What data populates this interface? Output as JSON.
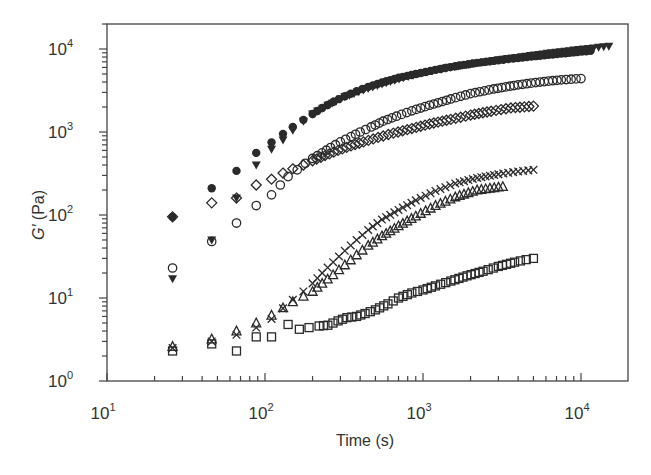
{
  "chart_data": {
    "type": "scatter",
    "title": "",
    "xlabel": "Time (s)",
    "ylabel": "G′ (Pa)",
    "xscale": "log",
    "yscale": "log",
    "xlim": [
      10,
      20000
    ],
    "ylim": [
      1,
      20000
    ],
    "x_ticks": [
      {
        "base": "10",
        "exp": "1",
        "value": 10
      },
      {
        "base": "10",
        "exp": "2",
        "value": 100
      },
      {
        "base": "10",
        "exp": "3",
        "value": 1000
      },
      {
        "base": "10",
        "exp": "4",
        "value": 10000
      }
    ],
    "y_ticks": [
      {
        "base": "10",
        "exp": "0",
        "value": 1
      },
      {
        "base": "10",
        "exp": "1",
        "value": 10
      },
      {
        "base": "10",
        "exp": "2",
        "value": 100
      },
      {
        "base": "10",
        "exp": "3",
        "value": 1000
      },
      {
        "base": "10",
        "exp": "4",
        "value": 10000
      }
    ],
    "grid": false,
    "legend": null,
    "series": [
      {
        "name": "filled-circle",
        "marker": "circle-filled",
        "x": [
          26,
          46,
          66,
          88,
          110,
          130,
          150,
          175,
          200,
          230,
          270,
          320,
          380,
          450,
          550,
          700,
          900,
          1200,
          1600,
          2200,
          3000,
          4000,
          5500,
          7500,
          9500,
          11500
        ],
        "y": [
          95,
          210,
          340,
          560,
          750,
          950,
          1150,
          1400,
          1650,
          1950,
          2300,
          2700,
          3100,
          3500,
          3950,
          4500,
          5000,
          5600,
          6200,
          6800,
          7300,
          7800,
          8300,
          8800,
          9200,
          9500
        ]
      },
      {
        "name": "filled-triangle-down",
        "marker": "triangle-down-filled",
        "x": [
          26,
          46,
          66,
          88,
          110,
          130,
          150,
          175,
          200,
          250,
          320,
          420,
          550,
          750,
          1000,
          1400,
          2000,
          3000,
          4500,
          6500,
          9000,
          12000,
          15000
        ],
        "y": [
          17,
          50,
          160,
          400,
          620,
          800,
          1050,
          1350,
          1650,
          2100,
          2650,
          3200,
          3800,
          4500,
          5200,
          5900,
          6600,
          7400,
          8200,
          9000,
          9700,
          10300,
          10800
        ]
      },
      {
        "name": "open-circle",
        "marker": "circle-open",
        "x": [
          26,
          46,
          66,
          88,
          110,
          125,
          140,
          160,
          180,
          200,
          230,
          260,
          300,
          350,
          400,
          470,
          560,
          680,
          850,
          1100,
          1500,
          2000,
          2800,
          4000,
          5500,
          7500,
          10000
        ],
        "y": [
          23,
          48,
          80,
          130,
          175,
          230,
          290,
          350,
          420,
          480,
          560,
          650,
          760,
          880,
          1000,
          1150,
          1350,
          1550,
          1800,
          2100,
          2500,
          2900,
          3300,
          3700,
          4000,
          4250,
          4400
        ]
      },
      {
        "name": "open-diamond",
        "marker": "diamond-open",
        "x": [
          26,
          46,
          66,
          88,
          110,
          130,
          150,
          175,
          200,
          240,
          290,
          350,
          420,
          520,
          650,
          850,
          1100,
          1500,
          2000,
          2700,
          3600,
          5000
        ],
        "y": [
          95,
          140,
          160,
          230,
          270,
          320,
          360,
          400,
          450,
          520,
          600,
          680,
          760,
          860,
          970,
          1100,
          1250,
          1420,
          1600,
          1780,
          1950,
          2050
        ]
      },
      {
        "name": "cross",
        "marker": "x",
        "x": [
          26,
          46,
          66,
          88,
          110,
          130,
          150,
          175,
          200,
          230,
          270,
          320,
          380,
          450,
          550,
          700,
          900,
          1200,
          1600,
          2200,
          3000,
          4000,
          5000
        ],
        "y": [
          2.5,
          3.0,
          3.6,
          4.4,
          5.6,
          7.5,
          9.5,
          12,
          15,
          20,
          27,
          37,
          50,
          66,
          88,
          115,
          150,
          195,
          240,
          280,
          310,
          335,
          350
        ]
      },
      {
        "name": "open-triangle-up",
        "marker": "triangle-up-open",
        "x": [
          26,
          46,
          66,
          88,
          110,
          130,
          150,
          175,
          200,
          230,
          270,
          320,
          380,
          450,
          550,
          700,
          900,
          1200,
          1600,
          2200,
          3200
        ],
        "y": [
          2.6,
          3.2,
          4.0,
          5.0,
          6.2,
          7.6,
          9.0,
          10.5,
          12,
          15,
          19,
          25,
          33,
          43,
          56,
          74,
          97,
          130,
          165,
          200,
          220
        ]
      },
      {
        "name": "open-square",
        "marker": "square-open",
        "x": [
          26,
          46,
          66,
          88,
          110,
          140,
          165,
          190,
          220,
          250,
          290,
          330,
          380,
          430,
          500,
          600,
          700,
          850,
          1000,
          1200,
          1500,
          1900,
          2400,
          3000,
          3800,
          4500,
          5000
        ],
        "y": [
          2.3,
          2.8,
          2.3,
          3.4,
          3.4,
          4.8,
          4.2,
          4.4,
          4.6,
          4.7,
          5.3,
          5.8,
          6.0,
          6.5,
          7.2,
          8.5,
          10,
          11.5,
          12.5,
          14,
          16,
          18.5,
          21,
          24,
          27,
          29,
          30
        ]
      }
    ]
  }
}
